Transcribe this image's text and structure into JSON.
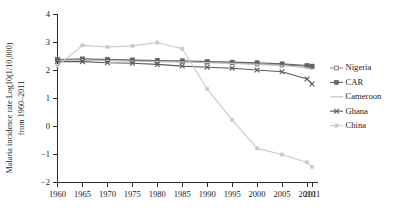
{
  "chart_data": {
    "type": "line",
    "title": "",
    "xlabel": "",
    "ylabel": "Malaria incidence rate Log10(1/10,000) from 1960–2011",
    "ylabel_line1": "Malaria incidence rate Log10(1/10,000)",
    "ylabel_line2": "from 1960–2011",
    "x": [
      1960,
      1965,
      1970,
      1975,
      1980,
      1985,
      1990,
      1995,
      2000,
      2005,
      2010,
      2011
    ],
    "xtick_labels": [
      "1960",
      "1965",
      "1970",
      "1975",
      "1980",
      "1985",
      "1990",
      "1995",
      "2000",
      "2005",
      "2010",
      "2011"
    ],
    "ytick_labels": [
      "4",
      "3",
      "2",
      "1",
      "0",
      "−1",
      "−2"
    ],
    "ytick_values": [
      4,
      3,
      2,
      1,
      0,
      -1,
      -2
    ],
    "xlim": [
      1960,
      2011
    ],
    "ylim": [
      -2,
      4
    ],
    "grid": false,
    "legend_position": "right",
    "series": [
      {
        "name": "Nigeria",
        "color": "#8c8c8c",
        "marker": "diamond",
        "values": [
          2.38,
          2.4,
          2.38,
          2.36,
          2.34,
          2.3,
          2.28,
          2.26,
          2.22,
          2.18,
          2.14,
          2.12
        ]
      },
      {
        "name": "CAR",
        "color": "#636363",
        "marker": "square",
        "values": [
          2.36,
          2.38,
          2.36,
          2.35,
          2.33,
          2.33,
          2.3,
          2.28,
          2.26,
          2.22,
          2.16,
          2.14
        ]
      },
      {
        "name": "Cameroon",
        "color": "#bdbdbd",
        "marker": "none",
        "values": [
          2.34,
          2.36,
          2.34,
          2.32,
          2.3,
          2.28,
          2.26,
          2.24,
          2.2,
          2.16,
          2.08,
          2.02
        ]
      },
      {
        "name": "Ghana",
        "color": "#5a5a5a",
        "marker": "x",
        "values": [
          2.3,
          2.3,
          2.26,
          2.24,
          2.2,
          2.14,
          2.1,
          2.06,
          2.0,
          1.94,
          1.68,
          1.5
        ]
      },
      {
        "name": "China",
        "color": "#c9c9c9",
        "marker": "dot",
        "values": [
          2.15,
          2.88,
          2.82,
          2.86,
          2.98,
          2.76,
          1.32,
          0.22,
          -0.8,
          -1.02,
          -1.3,
          -1.46
        ]
      }
    ]
  },
  "legend": {
    "items": [
      {
        "label": "Nigeria"
      },
      {
        "label": "CAR"
      },
      {
        "label": "Cameroon"
      },
      {
        "label": "Ghana"
      },
      {
        "label": "China"
      }
    ]
  }
}
